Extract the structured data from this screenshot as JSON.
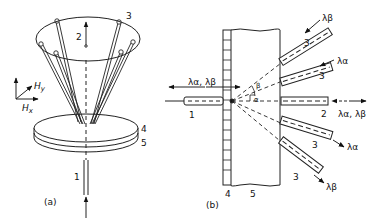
{
  "figure": {
    "panel_a": {
      "caption": "(a)",
      "labels": {
        "input_fiber": "1",
        "output_fiber": "2",
        "fiber_bundle": "3",
        "layer_top": "4",
        "layer_bottom": "5"
      },
      "axes": {
        "hx": "H",
        "hx_sub": "x",
        "hy": "H",
        "hy_sub": "y"
      }
    },
    "panel_b": {
      "caption": "(b)",
      "labels": {
        "input_fiber": "1",
        "output_fiber": "2",
        "fiber_3a": "3",
        "fiber_3b": "3",
        "fiber_3c": "3",
        "fiber_3d": "3",
        "grating": "4",
        "substrate": "5",
        "angle_alpha": "α",
        "angle_beta": "β"
      },
      "wavelengths": {
        "input": "λα, λβ",
        "output": "λα, λβ",
        "top": "λβ",
        "upper": "λα",
        "lower": "λα",
        "bottom": "λβ"
      }
    }
  }
}
